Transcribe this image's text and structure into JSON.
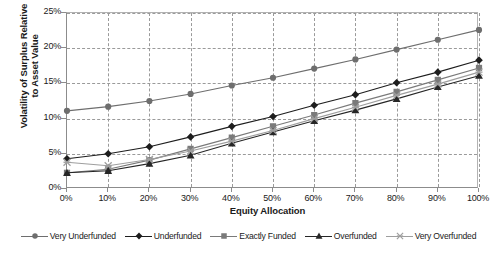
{
  "chart_data": {
    "type": "line",
    "title": "",
    "xlabel": "Equity Allocation",
    "ylabel_lines": [
      "Volatility of Surplus Relative",
      "to Asset Value"
    ],
    "ylabel": "Volatility of Surplus Relative to Asset Value",
    "categories": [
      "0%",
      "10%",
      "20%",
      "30%",
      "40%",
      "50%",
      "60%",
      "70%",
      "80%",
      "90%",
      "100%"
    ],
    "x": [
      0,
      10,
      20,
      30,
      40,
      50,
      60,
      70,
      80,
      90,
      100
    ],
    "xlim": [
      0,
      100
    ],
    "ylim": [
      0,
      25
    ],
    "yticks": [
      "0%",
      "5%",
      "10%",
      "15%",
      "20%",
      "25%"
    ],
    "ytick_values": [
      0,
      5,
      10,
      15,
      20,
      25
    ],
    "grid": true,
    "legend_position": "bottom",
    "series": [
      {
        "name": "Very Underfunded",
        "marker": "circle",
        "color": "#6e6e6e",
        "values": [
          11.1,
          11.7,
          12.5,
          13.5,
          14.7,
          15.8,
          17.1,
          18.4,
          19.8,
          21.2,
          22.6
        ]
      },
      {
        "name": "Underfunded",
        "marker": "diamond",
        "color": "#1d1d1d",
        "values": [
          4.3,
          5.0,
          6.0,
          7.4,
          8.9,
          10.3,
          11.9,
          13.4,
          15.1,
          16.6,
          18.3
        ]
      },
      {
        "name": "Exactly Funded",
        "marker": "square",
        "color": "#7a7a7a",
        "values": [
          2.3,
          2.8,
          4.1,
          5.7,
          7.3,
          8.9,
          10.5,
          12.2,
          13.8,
          15.5,
          17.2
        ]
      },
      {
        "name": "Overfunded",
        "marker": "triangle",
        "color": "#262626",
        "values": [
          2.3,
          2.6,
          3.6,
          4.8,
          6.5,
          8.1,
          9.7,
          11.2,
          12.8,
          14.5,
          16.1
        ]
      },
      {
        "name": "Very Overfunded",
        "marker": "asterisk",
        "color": "#9e9e9e",
        "values": [
          3.8,
          3.3,
          4.2,
          5.4,
          6.8,
          8.3,
          10.0,
          11.6,
          13.3,
          14.9,
          16.6
        ]
      }
    ]
  },
  "axis": {
    "grid_color": "#9a9a9a",
    "axis_color": "#8c8c8c",
    "frame_color": "#b3b3b3"
  }
}
